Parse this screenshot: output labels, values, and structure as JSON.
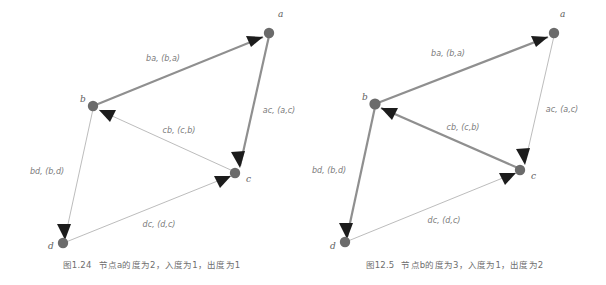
{
  "figures": [
    {
      "id": "figure-1-24",
      "caption_number": "图1.24",
      "caption_text": "节点a的度为2，入度为1，出度为1",
      "nodes": [
        {
          "id": "a",
          "label": "a",
          "cx": 269,
          "cy": 33,
          "lx": 278,
          "ly": 17
        },
        {
          "id": "b",
          "label": "b",
          "cx": 93,
          "cy": 106,
          "lx": 80,
          "ly": 102
        },
        {
          "id": "c",
          "label": "c",
          "cx": 235,
          "cy": 173,
          "lx": 246,
          "ly": 182
        },
        {
          "id": "d",
          "label": "d",
          "cx": 63,
          "cy": 243,
          "lx": 48,
          "ly": 249
        }
      ],
      "edges": [
        {
          "id": "ba",
          "label": "ba, (b,a)",
          "from": "b",
          "to": "a",
          "emphasis": "bold",
          "lx": 163,
          "ly": 61
        },
        {
          "id": "ac",
          "label": "ac, (a,c)",
          "from": "a",
          "to": "c",
          "emphasis": "bold",
          "lx": 279,
          "ly": 113
        },
        {
          "id": "cb",
          "label": "cb, (c,b)",
          "from": "c",
          "to": "b",
          "emphasis": "light",
          "lx": 179,
          "ly": 133
        },
        {
          "id": "bd",
          "label": "bd, (b,d)",
          "from": "b",
          "to": "d",
          "emphasis": "light",
          "lx": 47,
          "ly": 174
        },
        {
          "id": "dc",
          "label": "dc, (d,c)",
          "from": "d",
          "to": "c",
          "emphasis": "light",
          "lx": 159,
          "ly": 227
        }
      ]
    },
    {
      "id": "figure-12-5",
      "caption_number": "图12.5",
      "caption_text": "节点b的度为3，入度为1，出度为2",
      "nodes": [
        {
          "id": "a",
          "label": "a",
          "cx": 251,
          "cy": 33,
          "lx": 257,
          "ly": 17
        },
        {
          "id": "b",
          "label": "b",
          "cx": 72,
          "cy": 104,
          "lx": 60,
          "ly": 100
        },
        {
          "id": "c",
          "label": "c",
          "cx": 217,
          "cy": 170,
          "lx": 228,
          "ly": 179
        },
        {
          "id": "d",
          "label": "d",
          "cx": 42,
          "cy": 242,
          "lx": 28,
          "ly": 249
        }
      ],
      "edges": [
        {
          "id": "ba",
          "label": "ba, (b,a)",
          "from": "b",
          "to": "a",
          "emphasis": "bold",
          "lx": 145,
          "ly": 56
        },
        {
          "id": "ac",
          "label": "ac, (a,c)",
          "from": "a",
          "to": "c",
          "emphasis": "light",
          "lx": 259,
          "ly": 112
        },
        {
          "id": "cb",
          "label": "cb, (c,b)",
          "from": "c",
          "to": "b",
          "emphasis": "bold",
          "lx": 160,
          "ly": 130
        },
        {
          "id": "bd",
          "label": "bd, (b,d)",
          "from": "b",
          "to": "d",
          "emphasis": "bold",
          "lx": 26,
          "ly": 173
        },
        {
          "id": "dc",
          "label": "dc, (d,c)",
          "from": "d",
          "to": "c",
          "emphasis": "light",
          "lx": 141,
          "ly": 223
        }
      ]
    }
  ],
  "colors": {
    "node_fill": "#6b6b6b",
    "edge_bold": "#8f8f8f",
    "edge_light": "#b4b4b4",
    "arrow_fill": "#1c1c1c",
    "label_text": "#7a7a7a",
    "caption_text": "#6e6e6e",
    "background": "#ffffff"
  }
}
